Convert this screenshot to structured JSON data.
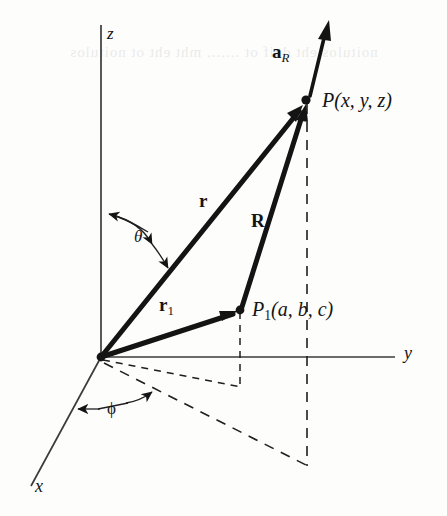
{
  "figure": {
    "background_color": "#fdfdfc",
    "ink_color": "#141414",
    "axis_color": "#3b3b3b",
    "dash_color": "#1f1f1f",
    "bleed_text": "noitulos eht dnif ot ....... mht eht ot noitulos"
  },
  "axes": {
    "z": {
      "label": "z",
      "style": "italic"
    },
    "y": {
      "label": "y",
      "style": "italic"
    },
    "x": {
      "label": "x",
      "style": "italic"
    }
  },
  "angles": {
    "theta": {
      "label": "θ",
      "description": "angle from z-axis to vector r"
    },
    "phi": {
      "label": "ϕ",
      "description": "azimuthal angle from x-axis in xy-plane"
    }
  },
  "vectors": [
    {
      "name": "r",
      "label": "r",
      "subscript": "",
      "bold": true,
      "from": "origin",
      "to": "P"
    },
    {
      "name": "R",
      "label": "R",
      "subscript": "",
      "bold": true,
      "from": "P1",
      "to": "P"
    },
    {
      "name": "r1",
      "label": "r",
      "subscript": "1",
      "bold": true,
      "from": "origin",
      "to": "P1"
    },
    {
      "name": "aR",
      "label": "a",
      "subscript": "R",
      "bold": true,
      "from": "P",
      "to": "unit-direction"
    }
  ],
  "points": [
    {
      "name": "P",
      "label": "P",
      "subscript": "",
      "coords": "(x, y, z)"
    },
    {
      "name": "P1",
      "label": "P",
      "subscript": "1",
      "coords": "(a, b, c)"
    }
  ],
  "labels": {
    "P_full": "P(x, y, z)",
    "P1_full": "P₁(a, b, c)",
    "P_paren": "(x, y, z)",
    "P1_paren": "(a, b, c)"
  },
  "geometry": {
    "origin": [
      101,
      357
    ],
    "z_top": [
      101,
      25
    ],
    "y_end": [
      395,
      357
    ],
    "x_end": [
      31,
      486
    ],
    "P": [
      306,
      100
    ],
    "P1": [
      240,
      310
    ],
    "aR_tip": [
      329,
      21
    ]
  }
}
